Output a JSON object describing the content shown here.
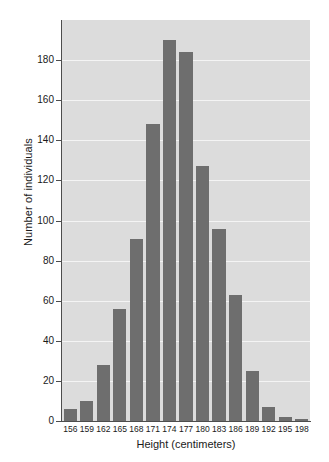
{
  "chart_data": {
    "type": "bar",
    "title": "",
    "xlabel": "Height (centimeters)",
    "ylabel": "Number of individuals",
    "categories": [
      "156",
      "159",
      "162",
      "165",
      "168",
      "171",
      "174",
      "177",
      "180",
      "183",
      "186",
      "189",
      "192",
      "195",
      "198"
    ],
    "values": [
      6,
      10,
      28,
      56,
      91,
      148,
      190,
      184,
      127,
      96,
      63,
      25,
      7,
      2,
      1
    ],
    "ylim": [
      0,
      200
    ],
    "yticks": [
      0,
      20,
      40,
      60,
      80,
      100,
      120,
      140,
      160,
      180
    ],
    "ytick_labels": [
      "0",
      "20",
      "40",
      "60",
      "80",
      "100",
      "120",
      "140",
      "160",
      "180"
    ],
    "grid": true,
    "legend": null,
    "colors": {
      "bar": "#6e6e6e",
      "plot_background": "#dcdcdc",
      "gridline": "#f4f4f4",
      "axis": "#4d4d4d",
      "text": "#1a1a1a",
      "figure_background": "#ffffff"
    }
  }
}
